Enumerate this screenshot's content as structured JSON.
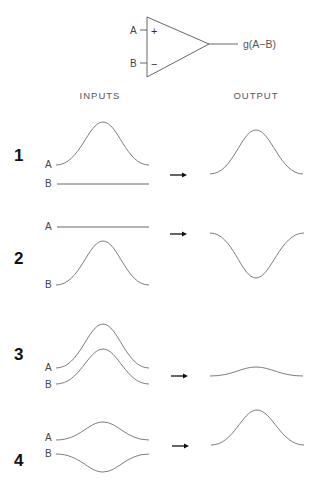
{
  "amplifier": {
    "input_a_label": "A",
    "input_b_label": "B",
    "plus_sign": "+",
    "minus_sign": "−",
    "output_label": "g(A−B)"
  },
  "headers": {
    "inputs": "INPUTS",
    "output": "OUTPUT"
  },
  "rows": [
    {
      "number": "1",
      "a_label": "A",
      "b_label": "B",
      "a_shape": "bump",
      "b_shape": "flat",
      "output_shape": "bump"
    },
    {
      "number": "2",
      "a_label": "A",
      "b_label": "B",
      "a_shape": "flat",
      "b_shape": "bump",
      "output_shape": "inverted-bump"
    },
    {
      "number": "3",
      "a_label": "A",
      "b_label": "B",
      "a_shape": "bump",
      "b_shape": "bump",
      "output_shape": "small-bump"
    },
    {
      "number": "4",
      "a_label": "A",
      "b_label": "B",
      "a_shape": "small-bump",
      "b_shape": "small-inverted-bump",
      "output_shape": "bump"
    }
  ]
}
